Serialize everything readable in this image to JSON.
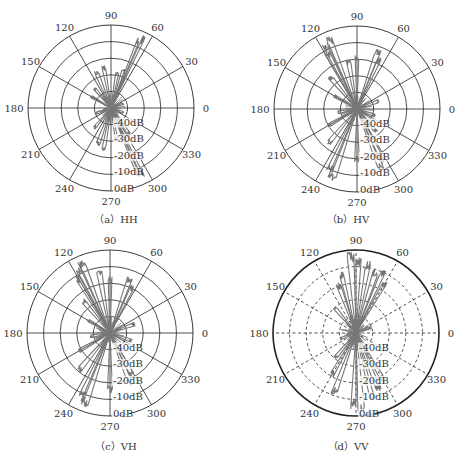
{
  "chart_data": [
    {
      "type": "polar",
      "id": "a",
      "caption": "（a）HH",
      "grid_style": "solid",
      "center": [
        111,
        108
      ],
      "radius": 83,
      "caption_y": 211,
      "angle_ticks": [
        0,
        30,
        60,
        90,
        120,
        150,
        180,
        210,
        240,
        270,
        300,
        330
      ],
      "radial_ticks": [
        "-40dB",
        "-30dB",
        "-20dB",
        "-10dB",
        "0dB"
      ],
      "radial_range_db": [
        -50,
        0
      ],
      "series_color": "#777777",
      "lobes": [
        {
          "angle": 65,
          "db": -2,
          "width": 2
        },
        {
          "angle": 68,
          "db": -3,
          "width": 2
        },
        {
          "angle": 295,
          "db": -4,
          "width": 2
        },
        {
          "angle": 292,
          "db": -5,
          "width": 2
        },
        {
          "angle": 112,
          "db": -26,
          "width": 6
        },
        {
          "angle": 100,
          "db": -24,
          "width": 5
        },
        {
          "angle": 80,
          "db": -28,
          "width": 5
        },
        {
          "angle": 72,
          "db": -24,
          "width": 4
        },
        {
          "angle": 130,
          "db": -34,
          "width": 6
        },
        {
          "angle": 150,
          "db": -36,
          "width": 6
        },
        {
          "angle": 250,
          "db": -26,
          "width": 6
        },
        {
          "angle": 260,
          "db": -24,
          "width": 5
        },
        {
          "angle": 230,
          "db": -34,
          "width": 6
        },
        {
          "angle": 280,
          "db": -30,
          "width": 5
        },
        {
          "angle": 305,
          "db": -30,
          "width": 5
        },
        {
          "angle": 20,
          "db": -42,
          "width": 8
        },
        {
          "angle": 200,
          "db": -40,
          "width": 8
        },
        {
          "angle": 340,
          "db": -42,
          "width": 8
        }
      ]
    },
    {
      "type": "polar",
      "id": "b",
      "caption": "（b）HV",
      "grid_style": "solid",
      "center": [
        357,
        109
      ],
      "radius": 83,
      "caption_y": 211,
      "angle_ticks": [
        0,
        30,
        60,
        90,
        120,
        150,
        180,
        210,
        240,
        270,
        300,
        330
      ],
      "radial_ticks": [
        "-40dB",
        "-30dB",
        "-20dB",
        "-10dB",
        "0dB"
      ],
      "radial_range_db": [
        -50,
        0
      ],
      "series_color": "#777777",
      "lobes": [
        {
          "angle": 112,
          "db": -3,
          "width": 5
        },
        {
          "angle": 116,
          "db": -6,
          "width": 5
        },
        {
          "angle": 118,
          "db": -10,
          "width": 5
        },
        {
          "angle": 292,
          "db": -10,
          "width": 5
        },
        {
          "angle": 296,
          "db": -14,
          "width": 5
        },
        {
          "angle": 250,
          "db": -4,
          "width": 6
        },
        {
          "angle": 246,
          "db": -8,
          "width": 5
        },
        {
          "angle": 70,
          "db": -12,
          "width": 5
        },
        {
          "angle": 66,
          "db": -16,
          "width": 4
        },
        {
          "angle": 90,
          "db": -18,
          "width": 4
        },
        {
          "angle": 270,
          "db": -18,
          "width": 5
        },
        {
          "angle": 100,
          "db": -20,
          "width": 5
        },
        {
          "angle": 130,
          "db": -24,
          "width": 6
        },
        {
          "angle": 150,
          "db": -34,
          "width": 6
        },
        {
          "angle": 210,
          "db": -30,
          "width": 6
        },
        {
          "angle": 230,
          "db": -22,
          "width": 6
        },
        {
          "angle": 310,
          "db": -32,
          "width": 6
        },
        {
          "angle": 20,
          "db": -36,
          "width": 8
        },
        {
          "angle": 340,
          "db": -38,
          "width": 8
        },
        {
          "angle": 190,
          "db": -38,
          "width": 8
        }
      ]
    },
    {
      "type": "polar",
      "id": "c",
      "caption": "（c）VH",
      "grid_style": "solid",
      "center": [
        110,
        333
      ],
      "radius": 83,
      "caption_y": 438,
      "angle_ticks": [
        0,
        30,
        60,
        90,
        120,
        150,
        180,
        210,
        240,
        270,
        300,
        330
      ],
      "radial_ticks": [
        "-40dB",
        "-30dB",
        "-20dB",
        "-10dB",
        "0dB"
      ],
      "radial_range_db": [
        -50,
        0
      ],
      "series_color": "#777777",
      "lobes": [
        {
          "angle": 112,
          "db": -3,
          "width": 5
        },
        {
          "angle": 116,
          "db": -6,
          "width": 5
        },
        {
          "angle": 120,
          "db": -10,
          "width": 5
        },
        {
          "angle": 250,
          "db": -3,
          "width": 6
        },
        {
          "angle": 246,
          "db": -7,
          "width": 5
        },
        {
          "angle": 292,
          "db": -16,
          "width": 5
        },
        {
          "angle": 298,
          "db": -20,
          "width": 5
        },
        {
          "angle": 70,
          "db": -14,
          "width": 5
        },
        {
          "angle": 64,
          "db": -18,
          "width": 4
        },
        {
          "angle": 90,
          "db": -16,
          "width": 4
        },
        {
          "angle": 270,
          "db": -14,
          "width": 5
        },
        {
          "angle": 100,
          "db": -12,
          "width": 5
        },
        {
          "angle": 130,
          "db": -24,
          "width": 6
        },
        {
          "angle": 150,
          "db": -34,
          "width": 6
        },
        {
          "angle": 210,
          "db": -28,
          "width": 6
        },
        {
          "angle": 230,
          "db": -20,
          "width": 6
        },
        {
          "angle": 20,
          "db": -34,
          "width": 8
        },
        {
          "angle": 340,
          "db": -36,
          "width": 8
        },
        {
          "angle": 190,
          "db": -38,
          "width": 8
        }
      ]
    },
    {
      "type": "polar",
      "id": "d",
      "caption": "（d）VV",
      "grid_style": "dashed",
      "center": [
        356,
        333
      ],
      "radius": 83,
      "caption_y": 438,
      "angle_ticks": [
        0,
        30,
        60,
        90,
        120,
        150,
        180,
        210,
        240,
        270,
        300,
        330
      ],
      "radial_ticks": [
        "-40dB",
        "-30dB",
        "-20dB",
        "-10dB",
        "0dB"
      ],
      "radial_range_db": [
        -50,
        0
      ],
      "series_color": "#777777",
      "lobes": [
        {
          "angle": 94,
          "db": -1,
          "width": 5
        },
        {
          "angle": 88,
          "db": -4,
          "width": 4
        },
        {
          "angle": 274,
          "db": -1,
          "width": 5
        },
        {
          "angle": 268,
          "db": -4,
          "width": 4
        },
        {
          "angle": 80,
          "db": -6,
          "width": 4
        },
        {
          "angle": 72,
          "db": -10,
          "width": 5
        },
        {
          "angle": 66,
          "db": -8,
          "width": 4
        },
        {
          "angle": 60,
          "db": -14,
          "width": 4
        },
        {
          "angle": 104,
          "db": -12,
          "width": 4
        },
        {
          "angle": 110,
          "db": -18,
          "width": 5
        },
        {
          "angle": 284,
          "db": -8,
          "width": 4
        },
        {
          "angle": 292,
          "db": -12,
          "width": 5
        },
        {
          "angle": 300,
          "db": -16,
          "width": 5
        },
        {
          "angle": 250,
          "db": -10,
          "width": 5
        },
        {
          "angle": 240,
          "db": -20,
          "width": 5
        },
        {
          "angle": 230,
          "db": -30,
          "width": 6
        },
        {
          "angle": 130,
          "db": -30,
          "width": 6
        },
        {
          "angle": 20,
          "db": -40,
          "width": 8
        },
        {
          "angle": 200,
          "db": -40,
          "width": 8
        }
      ]
    }
  ]
}
